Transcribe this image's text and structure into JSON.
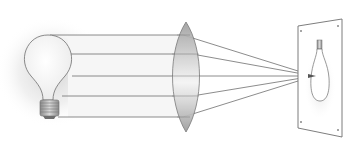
{
  "diagram": {
    "title": "Convex lens focusing light from a bulb onto a screen",
    "elements": {
      "source": "light-bulb",
      "lens": "convex-lens",
      "screen": "projection-screen",
      "image": "inverted-bulb-image"
    },
    "rays": [
      {
        "y": 35
      },
      {
        "y": 54
      },
      {
        "y": 76
      },
      {
        "y": 96
      },
      {
        "y": 117
      }
    ],
    "lens_refraction_x": [
      183,
      192,
      196,
      192,
      183
    ],
    "focal_point": {
      "x": 314,
      "y": 76
    },
    "colors": {
      "line": "#6e6e6e",
      "lens_fill": "#bdbdbd",
      "screen_fill": "#ffffff",
      "glow": "#cfcfcf"
    }
  }
}
